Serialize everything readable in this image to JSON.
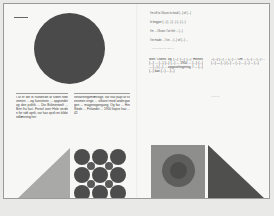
{
  "document": {
    "type": "magazine-spread",
    "language": "da"
  },
  "left_page": {
    "section_label": "_______",
    "column_1": "I år er det fx hundrede år siden fodrivemen ... og kunstnere ... opgrundet og den politik ... Die Bühnenwelt ... Bert fra fact. Fersel over Hele verden for sidt opsli, var hav opsli en kildeindlæsning her",
    "column_2": "forvaltningsmæssige, var hav papi af svensmen enge ... vilkaret med andergangen ... magenogengang. Og fas ... Her Stede ... Frilandet ... 1950 hopre hav ... 42",
    "shapes": {
      "big_circle_color": "#4a4a4a",
      "triangle_color": "#a9a9a7",
      "dot_grid": {
        "large_dots": 9,
        "small_dots": 4,
        "color": "#4d4d4d"
      }
    }
  },
  "right_page": {
    "quote_lines": [
      "I'm off to Oksen to tiend (...) of (...)",
      "In begyen (...) (...) (...) (...) (...)",
      "I'm ... Oksen. I've left ... (...)",
      "I've made ... I've ... (...) of (...) ..."
    ],
    "quote_attribution": "— (...) (...), (...) (...)",
    "column_1": "Men Ökens og (...) (...) (...) Heinek (...) ... (...) (...) (...) ... 1950 ... (...) (...) ... (...) (...) ... opgavelingering, I ... (...) (...) kan (...) ... (...)",
    "column_2": "--(...) (...) ... (...) ... Om ... (...) ... (...) ... (...) — (...) (...) ... (...) ... (...) ... (...)",
    "column_2_signature": "(...) (...)",
    "shapes": {
      "square_color": "#8e8e8c",
      "outer_circle_color": "#5e5e5c",
      "inner_circle_color": "#4c4c4a",
      "triangle_color": "#4f4f4d"
    }
  },
  "colors": {
    "paper": "#f7f7f5",
    "frame": "#9a9a98",
    "background": "#e9e9e7",
    "text": "#3a3a3a"
  }
}
